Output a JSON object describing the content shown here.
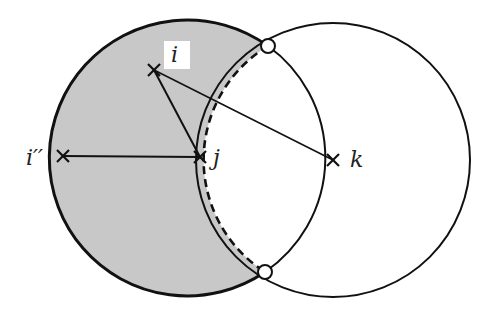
{
  "diagram": {
    "colors": {
      "stroke": "#111111",
      "shade": "#c8c8c8",
      "background": "#ffffff",
      "marker_fill": "#ffffff"
    },
    "points": [
      {
        "id": "i",
        "label": "i",
        "x": 154,
        "y": 70
      },
      {
        "id": "i2",
        "label": "i''",
        "x": 63,
        "y": 156
      },
      {
        "id": "j",
        "label": "j",
        "x": 200,
        "y": 157
      },
      {
        "id": "k",
        "label": "k",
        "x": 333,
        "y": 160
      }
    ],
    "labels": {
      "i": "i",
      "i2": "i′′",
      "j": "j",
      "k": "k"
    },
    "circles": [
      {
        "center": "j",
        "radius": 138,
        "style": "solid"
      },
      {
        "center": "k",
        "radius": 137,
        "style": "solid"
      },
      {
        "center": "k",
        "radius": 133,
        "style": "dashed",
        "portion": "arc inside left circle"
      }
    ],
    "segments": [
      {
        "from": "i",
        "to": "j"
      },
      {
        "from": "i",
        "to": "k"
      },
      {
        "from": "i2",
        "to": "j"
      }
    ],
    "intersection_markers": [
      {
        "x": 268,
        "y": 46
      },
      {
        "x": 265,
        "y": 272
      }
    ]
  }
}
